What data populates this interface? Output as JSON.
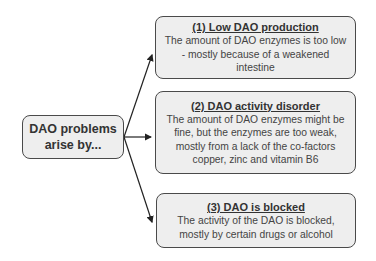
{
  "diagram": {
    "root": {
      "line1": "DAO problems",
      "line2": "arise by..."
    },
    "causes": [
      {
        "title": "(1) Low DAO production",
        "text": "The amount of DAO enzymes is too low - mostly because of a weakened intestine"
      },
      {
        "title": "(2) DAO activity disorder",
        "text": "The amount of DAO enzymes might be fine, but the enzymes are too weak, mostly from a lack of the co-factors copper, zinc and vitamin B6"
      },
      {
        "title": "(3) DAO is blocked",
        "text": "The activity of the DAO is blocked, mostly by certain drugs or alcohol"
      }
    ],
    "colors": {
      "box_fill": "#eeeeee",
      "box_border": "#4a4a4a",
      "arrow": "#222222"
    }
  }
}
